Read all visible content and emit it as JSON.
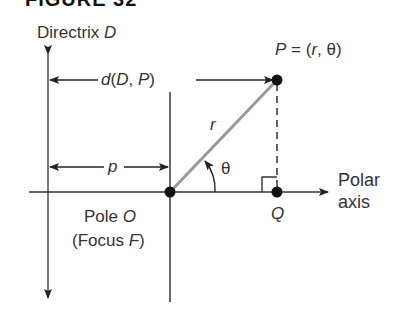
{
  "figure": {
    "title": "FIGURE 32",
    "labels": {
      "directrix": "Directrix",
      "directrix_var": "D",
      "point_P": "P",
      "point_P_eq": " = (",
      "point_P_r": "r",
      "point_P_sep": ", θ)",
      "distance_d": "d",
      "distance_args_open": "(",
      "distance_D": "D",
      "distance_comma": ", ",
      "distance_P": "P",
      "distance_close": ")",
      "radius": "r",
      "angle": "θ",
      "p_dist": "p",
      "pole": "Pole",
      "pole_var": "O",
      "focus_open": "(Focus ",
      "focus_var": "F",
      "focus_close": ")",
      "point_Q": "Q",
      "polar_axis_line1": "Polar",
      "polar_axis_line2": "axis"
    },
    "colors": {
      "line": "#333333",
      "radius_line": "#999999",
      "text": "#333333"
    }
  }
}
